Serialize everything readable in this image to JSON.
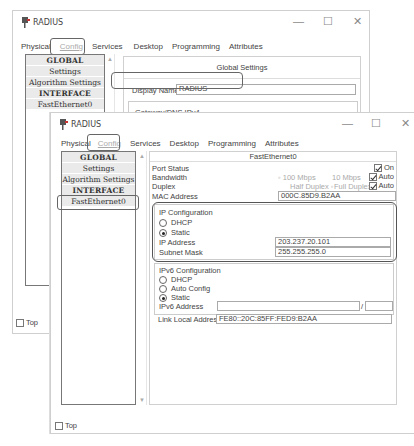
{
  "back_window": {
    "title": "RADIUS",
    "controls": {
      "minimize": "—",
      "maximize": "☐",
      "close": "✕"
    },
    "tabs": [
      "Physical",
      "Config",
      "Services",
      "Desktop",
      "Programming",
      "Attributes"
    ],
    "active_tab": "Config",
    "sidebar": [
      "GLOBAL",
      "Settings",
      "Algorithm Settings",
      "INTERFACE",
      "FastEthernet0"
    ],
    "panel_title": "Global Settings",
    "display_name_label": "Display Name",
    "display_name_value": "RADIUS",
    "gateway_label": "Gateway/DNS IPv4",
    "dhcp_label": "DHCP",
    "top_label": "Top"
  },
  "front_window": {
    "title": "RADIUS",
    "controls": {
      "minimize": "—",
      "maximize": "☐",
      "close": "✕"
    },
    "tabs": [
      "Physical",
      "Config",
      "Services",
      "Desktop",
      "Programming",
      "Attributes"
    ],
    "active_tab": "Config",
    "sidebar": [
      "GLOBAL",
      "Settings",
      "Algorithm Settings",
      "INTERFACE",
      "FastEthernet0"
    ],
    "selected_item": "FastEthernet0",
    "panel_title": "FastEthernet0",
    "port_status_label": "Port Status",
    "port_status_on": "On",
    "bandwidth_label": "Bandwidth",
    "bandwidth_100": "100 Mbps",
    "bandwidth_10": "10 Mbps",
    "auto_label": "Auto",
    "duplex_label": "Duplex",
    "half_duplex": "Half Duplex",
    "full_duplex": "Full Duplex",
    "mac_label": "MAC Address",
    "mac_value": "000C.85D9.B2AA",
    "ipv4": {
      "title": "IP Configuration",
      "dhcp": "DHCP",
      "static": "Static",
      "ip_label": "IP Address",
      "ip_value": "203.237.20.101",
      "mask_label": "Subnet Mask",
      "mask_value": "255.255.255.0"
    },
    "ipv6": {
      "title": "IPv6 Configuration",
      "dhcp": "DHCP",
      "auto": "Auto Config",
      "static": "Static",
      "addr_label": "IPv6 Address",
      "addr_value": "",
      "slash": "/",
      "link_label": "Link Local Address",
      "link_value": "FE80::20C:85FF:FED9:B2AA"
    },
    "top_label": "Top"
  }
}
